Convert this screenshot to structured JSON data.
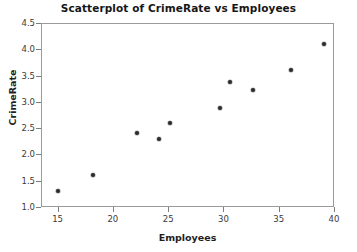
{
  "chart_data": {
    "type": "scatter",
    "title": "Scatterplot of CrimeRate vs Employees",
    "xlabel": "Employees",
    "ylabel": "CrimeRate",
    "xlim": [
      13.5,
      40.0
    ],
    "ylim": [
      1.0,
      4.5
    ],
    "grid": false,
    "legend": null,
    "xticks": [
      15,
      20,
      25,
      30,
      35,
      40
    ],
    "xtick_labels": [
      "15",
      "20",
      "25",
      "30",
      "35",
      "40"
    ],
    "yticks": [
      1.0,
      1.5,
      2.0,
      2.5,
      3.0,
      3.5,
      4.0,
      4.5
    ],
    "ytick_labels": [
      "1.0",
      "1.5",
      "2.0",
      "2.5",
      "3.0",
      "3.5",
      "4.0",
      "4.5"
    ],
    "marker": "filled-circle",
    "marker_color": "#2b2b2b",
    "points": [
      {
        "x": 15.0,
        "y": 1.3
      },
      {
        "x": 18.2,
        "y": 1.6
      },
      {
        "x": 22.2,
        "y": 2.4
      },
      {
        "x": 24.2,
        "y": 2.3
      },
      {
        "x": 25.2,
        "y": 2.6
      },
      {
        "x": 29.7,
        "y": 2.88
      },
      {
        "x": 30.6,
        "y": 3.38
      },
      {
        "x": 32.7,
        "y": 3.22
      },
      {
        "x": 36.1,
        "y": 3.6
      },
      {
        "x": 39.1,
        "y": 4.1
      }
    ],
    "x": [
      15.0,
      18.2,
      22.2,
      24.2,
      25.2,
      29.7,
      30.6,
      32.7,
      36.1,
      39.1
    ],
    "values": [
      1.3,
      1.6,
      2.4,
      2.3,
      2.6,
      2.88,
      3.38,
      3.22,
      3.6,
      4.1
    ]
  },
  "colors": {
    "frame": "#9a9a9a",
    "tick": "#7d7d7d",
    "text": "#1a1a1a",
    "marker": "#2b2b2b",
    "background": "#ffffff"
  }
}
